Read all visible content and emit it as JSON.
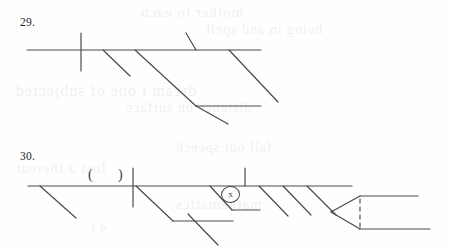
{
  "page": {
    "background_color": "#fefefe",
    "ink_color": "#4a4a4a",
    "text_color": "#1f1f1f",
    "width": 451,
    "height": 247
  },
  "ghost_text": {
    "lines": [
      "mother to each",
      "being in and spell",
      "dream i one of subjected",
      "distance on surface",
      "fall out speech",
      "lost a thereat",
      "mathematics",
      "a j"
    ]
  },
  "exercises": [
    {
      "number": "29.",
      "label": "sentence-diagram-29",
      "annotations": [],
      "strokes": [
        {
          "name": "baseline",
          "type": "line",
          "x1": 27,
          "y1": 50,
          "x2": 261,
          "y2": 50
        },
        {
          "name": "subject-verb-divider",
          "type": "line",
          "x1": 81,
          "y1": 33,
          "x2": 81,
          "y2": 71
        },
        {
          "name": "modifier-slant-1",
          "type": "line",
          "x1": 103,
          "y1": 50,
          "x2": 130,
          "y2": 76
        },
        {
          "name": "modifier-slant-2",
          "type": "line",
          "x1": 135,
          "y1": 50,
          "x2": 196,
          "y2": 106
        },
        {
          "name": "modifier-slant-3",
          "type": "line",
          "x1": 186,
          "y1": 33,
          "x2": 196,
          "y2": 50
        },
        {
          "name": "modifier-slant-4",
          "type": "line",
          "x1": 229,
          "y1": 50,
          "x2": 278,
          "y2": 102
        },
        {
          "name": "secondary-baseline",
          "type": "line",
          "x1": 196,
          "y1": 106,
          "x2": 261,
          "y2": 106
        },
        {
          "name": "modifier-slant-5",
          "type": "line",
          "x1": 196,
          "y1": 106,
          "x2": 228,
          "y2": 124
        }
      ]
    },
    {
      "number": "30.",
      "label": "sentence-diagram-30",
      "annotations": [
        {
          "name": "parenthesis-open",
          "text": "("
        },
        {
          "name": "parenthesis-close",
          "text": ")"
        },
        {
          "name": "circled-correction-mark",
          "text": "x"
        }
      ],
      "strokes": [
        {
          "name": "baseline",
          "type": "line",
          "x1": 28,
          "y1": 186,
          "x2": 352,
          "y2": 186
        },
        {
          "name": "modifier-slant-1",
          "type": "line",
          "x1": 40,
          "y1": 186,
          "x2": 76,
          "y2": 218
        },
        {
          "name": "subject-verb-divider",
          "type": "line",
          "x1": 133,
          "y1": 168,
          "x2": 133,
          "y2": 207
        },
        {
          "name": "modifier-slant-2",
          "type": "line",
          "x1": 136,
          "y1": 186,
          "x2": 173,
          "y2": 221
        },
        {
          "name": "secondary-baseline-1",
          "type": "line",
          "x1": 173,
          "y1": 221,
          "x2": 233,
          "y2": 221
        },
        {
          "name": "modifier-slant-3",
          "type": "line",
          "x1": 188,
          "y1": 214,
          "x2": 218,
          "y2": 245
        },
        {
          "name": "modifier-slant-4",
          "type": "line",
          "x1": 210,
          "y1": 186,
          "x2": 232,
          "y2": 210
        },
        {
          "name": "secondary-baseline-2",
          "type": "line",
          "x1": 232,
          "y1": 210,
          "x2": 260,
          "y2": 210
        },
        {
          "name": "verb-complement-tick",
          "type": "line",
          "x1": 245,
          "y1": 168,
          "x2": 245,
          "y2": 186
        },
        {
          "name": "modifier-slant-5",
          "type": "line",
          "x1": 259,
          "y1": 186,
          "x2": 288,
          "y2": 216
        },
        {
          "name": "modifier-slant-6",
          "type": "line",
          "x1": 283,
          "y1": 186,
          "x2": 311,
          "y2": 215
        },
        {
          "name": "modifier-slant-7",
          "type": "line",
          "x1": 307,
          "y1": 186,
          "x2": 336,
          "y2": 215
        },
        {
          "name": "compound-fork-upper",
          "type": "line",
          "x1": 331,
          "y1": 212,
          "x2": 360,
          "y2": 196
        },
        {
          "name": "compound-fork-lower",
          "type": "line",
          "x1": 331,
          "y1": 212,
          "x2": 360,
          "y2": 229
        },
        {
          "name": "compound-baseline-upper",
          "type": "line",
          "x1": 360,
          "y1": 196,
          "x2": 418,
          "y2": 196
        },
        {
          "name": "compound-baseline-lower",
          "type": "line",
          "x1": 360,
          "y1": 229,
          "x2": 430,
          "y2": 229
        },
        {
          "name": "compound-connector",
          "type": "dashed-line",
          "x1": 360,
          "y1": 199,
          "x2": 360,
          "y2": 227
        }
      ]
    }
  ]
}
